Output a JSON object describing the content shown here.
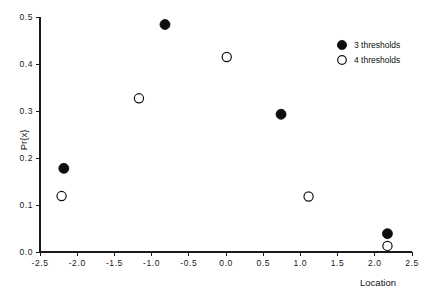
{
  "chart_data": {
    "type": "scatter",
    "title": "",
    "xlabel": "Location",
    "ylabel": "Pr{x}",
    "xlim": [
      -2.5,
      2.5
    ],
    "ylim": [
      0.0,
      0.5
    ],
    "xticks": [
      "-2.5",
      "-2.0",
      "-1.5",
      "-1.0",
      "-0.5",
      "0.0",
      "0.5",
      "1.0",
      "1.5",
      "2.0",
      "2.5"
    ],
    "xtick_values": [
      -2.5,
      -2.0,
      -1.5,
      -1.0,
      -0.5,
      0.0,
      0.5,
      1.0,
      1.5,
      2.0,
      2.5
    ],
    "yticks": [
      "0.0",
      "0.1",
      "0.2",
      "0.3",
      "0.4",
      "0.5"
    ],
    "ytick_values": [
      0.0,
      0.1,
      0.2,
      0.3,
      0.4,
      0.5
    ],
    "grid": false,
    "legend_position": "top-right",
    "series": [
      {
        "name": "3 thresholds",
        "marker": "filled-circle",
        "color": "#0d0d0d",
        "points": [
          {
            "x": -2.18,
            "y": 0.178
          },
          {
            "x": -0.82,
            "y": 0.484
          },
          {
            "x": 0.74,
            "y": 0.293
          },
          {
            "x": 2.17,
            "y": 0.039
          }
        ]
      },
      {
        "name": "4 thresholds",
        "marker": "open-circle",
        "color": "#111111",
        "points": [
          {
            "x": -2.21,
            "y": 0.119
          },
          {
            "x": -1.17,
            "y": 0.327
          },
          {
            "x": 0.01,
            "y": 0.415
          },
          {
            "x": 1.11,
            "y": 0.118
          },
          {
            "x": 2.17,
            "y": 0.013
          }
        ]
      }
    ]
  },
  "legend": {
    "entries": [
      {
        "label": "3 thresholds",
        "marker": "filled-circle"
      },
      {
        "label": "4 thresholds",
        "marker": "open-circle"
      }
    ]
  },
  "axes": {
    "x_title": "Location",
    "y_title": "Pr{x}"
  }
}
